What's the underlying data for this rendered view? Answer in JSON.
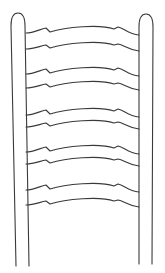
{
  "illustration": {
    "subject": "ladder-back chair back line drawing",
    "stroke_color": "#3a3a3a",
    "background_color": "#ffffff",
    "posts": [
      {
        "name": "left-post"
      },
      {
        "name": "right-post"
      }
    ],
    "slat_count": 5
  }
}
